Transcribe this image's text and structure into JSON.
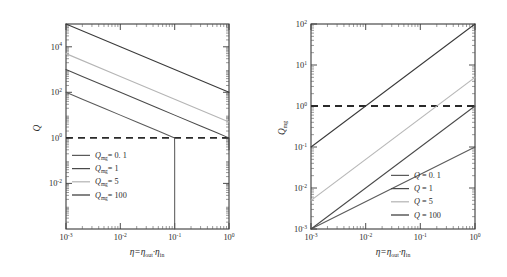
{
  "figure": {
    "background": "#ffffff",
    "panels": [
      "left",
      "right"
    ]
  },
  "chart_data": [
    {
      "id": "left",
      "type": "line",
      "title": "",
      "xlabel": "η = ηout·ηin",
      "ylabel": "Q",
      "xscale": "log",
      "yscale": "log",
      "xlim": [
        0.001,
        1
      ],
      "ylim": [
        0.0001,
        100000
      ],
      "xtick_labels": [
        "10−3",
        "10−2",
        "10−1",
        "10⁰"
      ],
      "xtick_values": [
        0.001,
        0.01,
        0.1,
        1
      ],
      "ytick_labels": [
        "10−2",
        "10⁰",
        "10²",
        "10⁴"
      ],
      "ytick_values": [
        0.01,
        1,
        100,
        10000
      ],
      "grid": false,
      "legend_position": "lower-left",
      "annotations": [
        {
          "name": "threshold-line",
          "type": "hline",
          "value": 1,
          "style": "dashed",
          "color": "#2a2a2a"
        }
      ],
      "series": [
        {
          "name": "Qmg= 0. 1",
          "param": 0.1,
          "color": "#5a5a5a",
          "x": [
            0.001,
            0.002,
            0.005,
            0.01,
            0.02,
            0.05,
            0.08,
            0.095,
            0.0995,
            0.1,
            0.1
          ],
          "y": [
            100,
            50,
            20,
            10,
            5,
            2,
            1.25,
            1.05,
            1.0,
            0.3,
            3e-05
          ]
        },
        {
          "name": "Qmg= 1",
          "param": 1,
          "color": "#4a4a4a",
          "x": [
            0.001,
            0.002,
            0.005,
            0.01,
            0.05,
            0.1,
            0.3,
            0.6,
            0.9,
            0.98,
            1.0,
            1.0
          ],
          "y": [
            1000,
            500,
            200,
            100,
            20,
            10,
            3.33,
            1.67,
            1.11,
            1.02,
            1.0,
            0.3
          ]
        },
        {
          "name": "Qmg= 5",
          "param": 5,
          "color": "#b5b5b5",
          "x": [
            0.001,
            0.01,
            0.1,
            1.0
          ],
          "y": [
            5000,
            500,
            50,
            5
          ]
        },
        {
          "name": "Qmg= 100",
          "param": 100,
          "color": "#3a3a3a",
          "x": [
            0.001,
            0.01,
            0.1,
            1.0
          ],
          "y": [
            100000,
            10000,
            1000,
            100
          ]
        }
      ]
    },
    {
      "id": "right",
      "type": "line",
      "title": "",
      "xlabel": "η = ηout·ηin",
      "ylabel": "Qmg",
      "xscale": "log",
      "yscale": "log",
      "xlim": [
        0.001,
        1
      ],
      "ylim": [
        0.001,
        100
      ],
      "xtick_labels": [
        "10−3",
        "10−2",
        "10−1",
        "10⁰"
      ],
      "xtick_values": [
        0.001,
        0.01,
        0.1,
        1
      ],
      "ytick_labels": [
        "10−3",
        "10−2",
        "10−1",
        "10⁰",
        "10¹",
        "10²"
      ],
      "ytick_values": [
        0.001,
        0.01,
        0.1,
        1,
        10,
        100
      ],
      "grid": false,
      "legend_position": "lower-right",
      "annotations": [
        {
          "name": "threshold-line",
          "type": "hline",
          "value": 1,
          "style": "dashed",
          "color": "#2a2a2a"
        }
      ],
      "series": [
        {
          "name": "Q = 0. 1",
          "param": 0.1,
          "color": "#5a5a5a",
          "x": [
            0.001,
            1.0
          ],
          "y": [
            0.0001,
            0.1
          ]
        },
        {
          "name": "Q = 1",
          "param": 1,
          "color": "#4a4a4a",
          "x": [
            0.001,
            1.0
          ],
          "y": [
            0.001,
            1.0
          ]
        },
        {
          "name": "Q = 5",
          "param": 5,
          "color": "#b5b5b5",
          "x": [
            0.001,
            1.0
          ],
          "y": [
            0.005,
            5.0
          ]
        },
        {
          "name": "Q = 100",
          "param": 100,
          "color": "#3a3a3a",
          "x": [
            0.001,
            1.0
          ],
          "y": [
            0.1,
            100.0
          ]
        }
      ]
    }
  ],
  "left_panel": {
    "ylabel_main": "Q",
    "xlabel_eta": "η",
    "xlabel_eq": "=",
    "xlabel_out": "η",
    "xlabel_out_sub": "out",
    "xlabel_dot": "·",
    "xlabel_in": "η",
    "xlabel_in_sub": "in",
    "xticks": [
      "10",
      "10",
      "10",
      "10"
    ],
    "xtick_sups": [
      "-3",
      "-2",
      "-1",
      "0"
    ],
    "yticks": [
      "10",
      "10",
      "10",
      "10"
    ],
    "ytick_sups": [
      "-2",
      "0",
      "2",
      "4"
    ],
    "legend": [
      {
        "symbol": "Q",
        "sub": "mg",
        "eq": "= 0. 1",
        "color": "#5a5a5a"
      },
      {
        "symbol": "Q",
        "sub": "mg",
        "eq": "= 1",
        "color": "#4a4a4a"
      },
      {
        "symbol": "Q",
        "sub": "mg",
        "eq": "= 5",
        "color": "#b5b5b5"
      },
      {
        "symbol": "Q",
        "sub": "mg",
        "eq": "= 100",
        "color": "#3a3a3a"
      }
    ]
  },
  "right_panel": {
    "ylabel_main": "Q",
    "ylabel_sub": "mg",
    "xlabel_eta": "η",
    "xlabel_eq": "=",
    "xlabel_out": "η",
    "xlabel_out_sub": "out",
    "xlabel_dot": "·",
    "xlabel_in": "η",
    "xlabel_in_sub": "in",
    "xticks": [
      "10",
      "10",
      "10",
      "10"
    ],
    "xtick_sups": [
      "-3",
      "-2",
      "-1",
      "0"
    ],
    "yticks": [
      "10",
      "10",
      "10",
      "10",
      "10",
      "10"
    ],
    "ytick_sups": [
      "-3",
      "-2",
      "-1",
      "0",
      "1",
      "2"
    ],
    "legend": [
      {
        "symbol": "Q",
        "sub": "",
        "eq": "= 0. 1",
        "color": "#5a5a5a"
      },
      {
        "symbol": "Q",
        "sub": "",
        "eq": "= 1",
        "color": "#4a4a4a"
      },
      {
        "symbol": "Q",
        "sub": "",
        "eq": "= 5",
        "color": "#b5b5b5"
      },
      {
        "symbol": "Q",
        "sub": "",
        "eq": "= 100",
        "color": "#3a3a3a"
      }
    ]
  }
}
